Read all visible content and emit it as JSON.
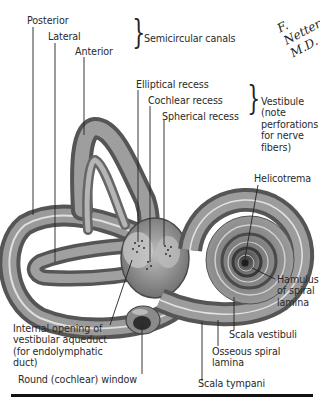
{
  "figure": {
    "signature": "F. Netter M.D."
  },
  "groups": {
    "semicircular_canals": "Semicircular canals",
    "vestibule": [
      "Vestibule",
      "(note",
      "perforations",
      "for nerve",
      "fibers)"
    ]
  },
  "labels": {
    "posterior": "Posterior",
    "lateral": "Lateral",
    "anterior": "Anterior",
    "elliptical_recess": "Elliptical recess",
    "cochlear_recess": "Cochlear recess",
    "spherical_recess": "Spherical recess",
    "helicotrema": "Helicotrema",
    "hamulus": [
      "Hamulus",
      "of spiral",
      "lamina"
    ],
    "scala_vestibuli": "Scala vestibuli",
    "osseous_spiral_lamina": [
      "Osseous spiral",
      "lamina"
    ],
    "scala_tympani": "Scala tympani",
    "round_window": "Round (cochlear) window",
    "vestibular_aqueduct": [
      "Internal opening of",
      "vestibular aqueduct",
      "(for endolymphatic",
      "duct)"
    ]
  },
  "colors": {
    "bone_dark": "#5a5a5a",
    "bone_mid": "#8c8c8c",
    "bone_light": "#d6d6d6",
    "leader": "#222222",
    "rule": "#111111"
  }
}
